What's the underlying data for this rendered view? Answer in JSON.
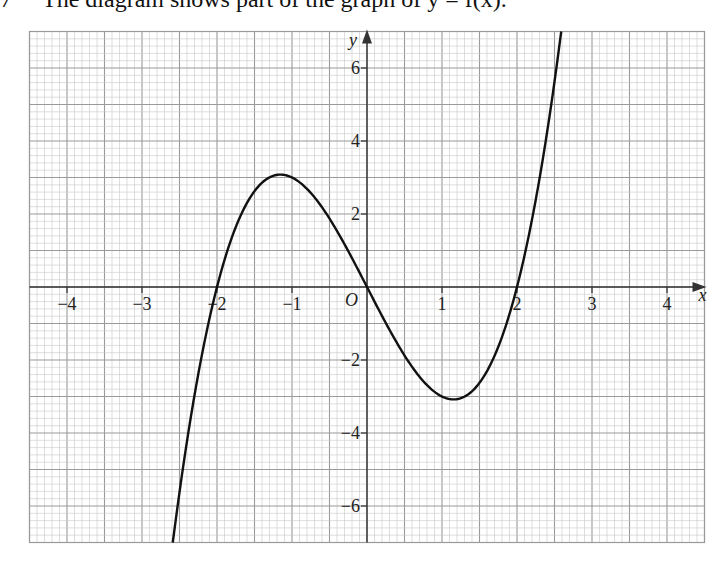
{
  "caption": {
    "number": "7",
    "text": "The diagram shows part of the graph of y = f(x)."
  },
  "chart_data": {
    "type": "line",
    "title": "The diagram shows part of the graph of y = f(x).",
    "function": "y = x^3 - 4x",
    "xlabel": "x",
    "ylabel": "y",
    "origin_label": "O",
    "xlim": [
      -4.5,
      4.5
    ],
    "ylim": [
      -7,
      7
    ],
    "grid": true,
    "grid_minor_x": 0.1,
    "grid_minor_y": 0.2,
    "x_ticks": [
      -4,
      -3,
      -2,
      -1,
      1,
      2,
      3,
      4
    ],
    "x_tick_labels": [
      "−4",
      "−3",
      "−2",
      "−1",
      "1",
      "2",
      "3",
      "4"
    ],
    "y_ticks": [
      -6,
      -4,
      -2,
      2,
      4,
      6
    ],
    "y_tick_labels": [
      "−6",
      "−4",
      "−2",
      "2",
      "4",
      "6"
    ],
    "key_points": {
      "x_intercepts": [
        -2,
        0,
        2
      ],
      "local_max": [
        -1.15,
        3.08
      ],
      "local_min": [
        1.15,
        -3.08
      ]
    },
    "series": [
      {
        "name": "f(x)",
        "x": [
          -2.59,
          -2.5,
          -2.25,
          -2.0,
          -1.75,
          -1.5,
          -1.25,
          -1.15,
          -1.0,
          -0.75,
          -0.5,
          -0.25,
          0.0,
          0.25,
          0.5,
          0.75,
          1.0,
          1.15,
          1.25,
          1.5,
          1.75,
          2.0,
          2.25,
          2.5,
          2.59
        ],
        "y": [
          -7.0,
          -5.63,
          -2.39,
          0.0,
          1.64,
          2.63,
          3.05,
          3.08,
          3.0,
          2.58,
          1.88,
          0.98,
          0.0,
          -0.98,
          -1.88,
          -2.58,
          -3.0,
          -3.08,
          -3.05,
          -2.63,
          -1.64,
          0.0,
          2.39,
          5.63,
          7.0
        ]
      }
    ]
  },
  "colors": {
    "grid_minor": "#c8c8c8",
    "grid_major": "#9a9a9a",
    "axis": "#333333",
    "curve": "#111111"
  }
}
